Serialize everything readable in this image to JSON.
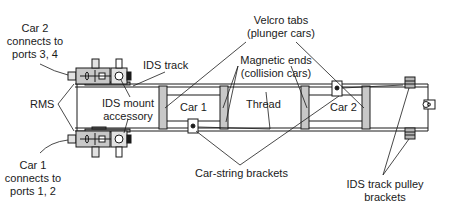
{
  "diagram": {
    "labels": {
      "car2_connects": [
        "Car 2",
        "connects to",
        "ports 3, 4"
      ],
      "car1_connects": [
        "Car 1",
        "connects to",
        "ports 1, 2"
      ],
      "rms": "RMS",
      "ids_track": "IDS track",
      "ids_mount": [
        "IDS mount",
        "accessory"
      ],
      "velcro": [
        "Velcro tabs",
        "(plunger cars)"
      ],
      "magnetic": [
        "Magnetic ends",
        "(collision cars)"
      ],
      "car1": "Car 1",
      "car2": "Car 2",
      "thread": "Thread",
      "car_string": "Car-string brackets",
      "pulley": [
        "IDS track pulley",
        "brackets"
      ]
    },
    "colors": {
      "line": "#1a1a1a",
      "fill_gray": "#c8c8c8",
      "fill_light": "#e2e2e2",
      "background": "#ffffff"
    }
  }
}
